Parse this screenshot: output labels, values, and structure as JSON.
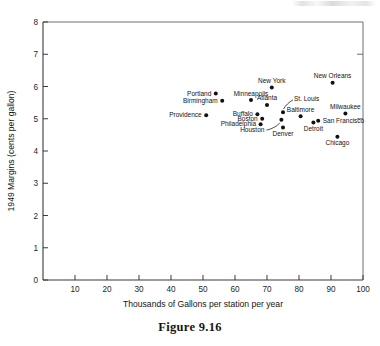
{
  "figure": {
    "caption": "Figure 9.16"
  },
  "chart_data": {
    "type": "scatter",
    "title": "",
    "xlabel": "Thousands of Gallons per station per year",
    "ylabel": "1949 Margins (cents per gallon)",
    "xlim": [
      0,
      100
    ],
    "ylim": [
      0,
      8
    ],
    "xticks": [
      10,
      20,
      30,
      40,
      50,
      60,
      70,
      80,
      90,
      100
    ],
    "yticks": [
      0,
      1,
      2,
      3,
      4,
      5,
      6,
      7,
      8
    ],
    "grid": false,
    "legend": "none",
    "point_color": "#111111",
    "points": [
      {
        "label": "Portland",
        "x": 54.0,
        "y": 5.78,
        "label_side": "left"
      },
      {
        "label": "Birmingham",
        "x": 56.0,
        "y": 5.56,
        "label_side": "left"
      },
      {
        "label": "Providence",
        "x": 51.0,
        "y": 5.11,
        "label_side": "left"
      },
      {
        "label": "Minneapolis",
        "x": 65.0,
        "y": 5.58,
        "label_side": "above"
      },
      {
        "label": "Buffalo",
        "x": 67.0,
        "y": 5.14,
        "label_side": "left"
      },
      {
        "label": "Boston",
        "x": 68.5,
        "y": 5.0,
        "label_side": "left"
      },
      {
        "label": "Philadelphia",
        "x": 68.0,
        "y": 4.83,
        "label_side": "left"
      },
      {
        "label": "Atlanta",
        "x": 70.0,
        "y": 5.43,
        "label_side": "above"
      },
      {
        "label": "New York",
        "x": 71.5,
        "y": 5.97,
        "label_side": "above"
      },
      {
        "label": "St. Louis",
        "x": 75.0,
        "y": 5.2,
        "label_side": "leader-upper-right"
      },
      {
        "label": "Houston",
        "x": 74.5,
        "y": 4.97,
        "label_side": "leader-lower-left"
      },
      {
        "label": "Denver",
        "x": 75.0,
        "y": 4.73,
        "label_side": "below"
      },
      {
        "label": "Baltimore",
        "x": 80.5,
        "y": 5.08,
        "label_side": "above"
      },
      {
        "label": "Detroit",
        "x": 84.5,
        "y": 4.88,
        "label_side": "below"
      },
      {
        "label": "San Francisco",
        "x": 86.0,
        "y": 4.94,
        "label_side": "right"
      },
      {
        "label": "New Orleans",
        "x": 90.5,
        "y": 6.12,
        "label_side": "above"
      },
      {
        "label": "Milwaukee",
        "x": 94.5,
        "y": 5.16,
        "label_side": "above"
      },
      {
        "label": "Chicago",
        "x": 92.0,
        "y": 4.44,
        "label_side": "below"
      }
    ]
  }
}
